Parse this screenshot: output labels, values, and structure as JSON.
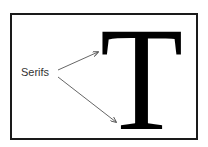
{
  "figure": {
    "letter": "T",
    "label": "Serifs",
    "arrows": [
      {
        "from": [
          58,
          70
        ],
        "to": [
          98,
          52
        ],
        "target": "top serif"
      },
      {
        "from": [
          58,
          77
        ],
        "to": [
          116,
          122
        ],
        "target": "bottom serif"
      }
    ],
    "colors": {
      "border": "#1a1a1a",
      "letter": "#000000",
      "arrow": "#555555",
      "text": "#333333"
    }
  }
}
